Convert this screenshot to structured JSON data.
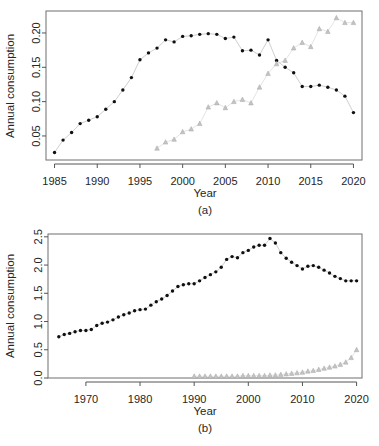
{
  "figure": {
    "panels": [
      {
        "id": "a",
        "caption": "(a)",
        "xlabel": "Year",
        "ylabel": "Annual consumption"
      },
      {
        "id": "b",
        "caption": "(b)",
        "xlabel": "Year",
        "ylabel": "Annual consumption"
      }
    ]
  },
  "chart_data": [
    {
      "type": "scatter",
      "panel": "a",
      "title": "",
      "xlabel": "Year",
      "ylabel": "Annual consumption",
      "xlim": [
        1984,
        2021
      ],
      "ylim": [
        0.015,
        0.232
      ],
      "xticks": [
        1985,
        1990,
        1995,
        2000,
        2005,
        2010,
        2015,
        2020
      ],
      "yticks": [
        0.05,
        0.1,
        0.15,
        0.2
      ],
      "ytick_labels": [
        "0.05",
        "0.10",
        "0.15",
        "0.20"
      ],
      "grid": false,
      "legend": "none",
      "series": [
        {
          "name": "dark-circles",
          "marker": "filled-circle",
          "color": "#101010",
          "x": [
            1985,
            1986,
            1987,
            1988,
            1989,
            1990,
            1991,
            1992,
            1993,
            1994,
            1995,
            1996,
            1997,
            1998,
            1999,
            2000,
            2001,
            2002,
            2003,
            2004,
            2005,
            2006,
            2007,
            2008,
            2009,
            2010,
            2011,
            2012,
            2013,
            2014,
            2015,
            2016,
            2017,
            2018,
            2019,
            2020
          ],
          "y": [
            0.026,
            0.044,
            0.055,
            0.068,
            0.073,
            0.078,
            0.089,
            0.1,
            0.117,
            0.135,
            0.161,
            0.171,
            0.178,
            0.19,
            0.187,
            0.195,
            0.196,
            0.198,
            0.199,
            0.198,
            0.192,
            0.194,
            0.174,
            0.175,
            0.168,
            0.19,
            0.16,
            0.15,
            0.142,
            0.122,
            0.122,
            0.124,
            0.121,
            0.117,
            0.108,
            0.084
          ]
        },
        {
          "name": "light-triangles",
          "marker": "open-triangle",
          "color": "#c3c3c3",
          "x": [
            1997,
            1998,
            1999,
            2000,
            2001,
            2002,
            2003,
            2004,
            2005,
            2006,
            2007,
            2008,
            2009,
            2010,
            2011,
            2012,
            2013,
            2014,
            2015,
            2016,
            2017,
            2018,
            2019,
            2020
          ],
          "y": [
            0.032,
            0.041,
            0.045,
            0.056,
            0.06,
            0.068,
            0.092,
            0.098,
            0.091,
            0.1,
            0.103,
            0.098,
            0.121,
            0.141,
            0.155,
            0.16,
            0.178,
            0.186,
            0.18,
            0.206,
            0.202,
            0.222,
            0.215,
            0.215
          ]
        }
      ]
    },
    {
      "type": "scatter",
      "panel": "b",
      "title": "",
      "xlabel": "Year",
      "ylabel": "Annual consumption",
      "xlim": [
        1963,
        2021
      ],
      "ylim": [
        0.0,
        2.55
      ],
      "xticks": [
        1970,
        1980,
        1990,
        2000,
        2010,
        2020
      ],
      "yticks": [
        0.0,
        0.5,
        1.0,
        1.5,
        2.0,
        2.5
      ],
      "ytick_labels": [
        "0.0",
        "0.5",
        "1.0",
        "1.5",
        "2.0",
        "2.5"
      ],
      "grid": false,
      "legend": "none",
      "series": [
        {
          "name": "dark-circles",
          "marker": "filled-circle",
          "color": "#101010",
          "x": [
            1965,
            1966,
            1967,
            1968,
            1969,
            1970,
            1971,
            1972,
            1973,
            1974,
            1975,
            1976,
            1977,
            1978,
            1979,
            1980,
            1981,
            1982,
            1983,
            1984,
            1985,
            1986,
            1987,
            1988,
            1989,
            1990,
            1991,
            1992,
            1993,
            1994,
            1995,
            1996,
            1997,
            1998,
            1999,
            2000,
            2001,
            2002,
            2003,
            2004,
            2005,
            2006,
            2007,
            2008,
            2009,
            2010,
            2011,
            2012,
            2013,
            2014,
            2015,
            2016,
            2017,
            2018,
            2019,
            2020
          ],
          "y": [
            0.73,
            0.77,
            0.79,
            0.82,
            0.84,
            0.84,
            0.86,
            0.93,
            0.97,
            0.99,
            1.03,
            1.08,
            1.12,
            1.15,
            1.19,
            1.21,
            1.22,
            1.29,
            1.35,
            1.4,
            1.46,
            1.54,
            1.62,
            1.65,
            1.67,
            1.67,
            1.72,
            1.78,
            1.83,
            1.88,
            1.96,
            2.1,
            2.15,
            2.13,
            2.22,
            2.26,
            2.32,
            2.35,
            2.35,
            2.47,
            2.39,
            2.22,
            2.12,
            2.05,
            1.99,
            1.93,
            1.98,
            1.99,
            1.96,
            1.91,
            1.86,
            1.8,
            1.76,
            1.72,
            1.72,
            1.72
          ]
        },
        {
          "name": "light-triangles",
          "marker": "open-triangle",
          "color": "#c3c3c3",
          "x": [
            1990,
            1991,
            1992,
            1993,
            1994,
            1995,
            1996,
            1997,
            1998,
            1999,
            2000,
            2001,
            2002,
            2003,
            2004,
            2005,
            2006,
            2007,
            2008,
            2009,
            2010,
            2011,
            2012,
            2013,
            2014,
            2015,
            2016,
            2017,
            2018,
            2019,
            2020
          ],
          "y": [
            0.03,
            0.03,
            0.03,
            0.03,
            0.03,
            0.03,
            0.03,
            0.03,
            0.03,
            0.04,
            0.04,
            0.04,
            0.04,
            0.04,
            0.05,
            0.05,
            0.06,
            0.07,
            0.08,
            0.09,
            0.1,
            0.12,
            0.13,
            0.15,
            0.17,
            0.19,
            0.21,
            0.24,
            0.28,
            0.36,
            0.5
          ]
        }
      ]
    }
  ]
}
